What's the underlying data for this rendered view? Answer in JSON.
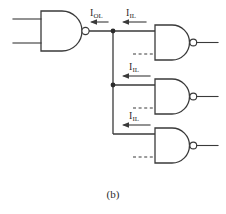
{
  "figure": {
    "caption": "(b)",
    "ink_color": "#3a3a3a",
    "background_color": "#ffffff"
  },
  "labels": {
    "output_current": {
      "symbol": "I",
      "subscript": "OL"
    },
    "input_current_1": {
      "symbol": "I",
      "subscript": "IL"
    },
    "input_current_2": {
      "symbol": "I",
      "subscript": "IL"
    },
    "input_current_3": {
      "symbol": "I",
      "subscript": "IL"
    }
  },
  "gates": {
    "driver": {
      "type": "NAND",
      "inputs": 2,
      "position": "left"
    },
    "load_1": {
      "type": "NAND",
      "inputs": 2,
      "position": "top-right"
    },
    "load_2": {
      "type": "NAND",
      "inputs": 2,
      "position": "middle-right"
    },
    "load_3": {
      "type": "NAND",
      "inputs": 2,
      "position": "bottom-right"
    }
  }
}
